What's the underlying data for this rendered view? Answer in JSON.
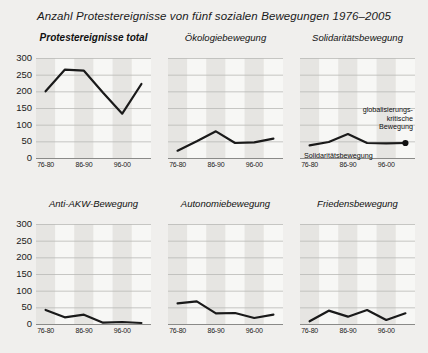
{
  "title": "Anzahl Protestereignisse von fünf sozialen Bewegungen 1976–2005",
  "axis": {
    "y_ticks": [
      "300",
      "250",
      "200",
      "150",
      "100",
      "50",
      "0"
    ],
    "x_ticks": [
      "76-80",
      "86-90",
      "96-00"
    ]
  },
  "annotations": {
    "global_line1": "globalisierungs-",
    "global_line2": "kritische",
    "global_line3": "Bewegung",
    "solidarity_inline": "Solidaritätsbewegung"
  },
  "chart_data": {
    "type": "line",
    "title": "Anzahl Protestereignisse von fünf sozialen Bewegungen 1976–2005",
    "xlabel": "",
    "ylabel": "Anzahl Protestereignisse",
    "ylim": [
      0,
      300
    ],
    "ytick_step": 50,
    "grid": true,
    "legend": "none",
    "categories": [
      "76-80",
      "81-85",
      "86-90",
      "91-95",
      "96-00",
      "01-05"
    ],
    "tick_categories": [
      "76-80",
      "86-90",
      "96-00"
    ],
    "panels": [
      {
        "title": "Protestereignisse total",
        "emphasis": "bold",
        "values": [
          200,
          265,
          262,
          196,
          133,
          222
        ]
      },
      {
        "title": "Ökologiebewegung",
        "emphasis": "normal",
        "values": [
          22,
          50,
          80,
          45,
          47,
          58
        ]
      },
      {
        "title": "Solidaritätsbewegung",
        "emphasis": "normal",
        "values": [
          38,
          48,
          72,
          45,
          44,
          45
        ],
        "endpoint_marker": true,
        "annotations": [
          {
            "text": "globalisierungs-kritische Bewegung",
            "target": "endpoint"
          },
          {
            "text": "Solidaritätsbewegung",
            "target": "series"
          }
        ]
      },
      {
        "title": "Anti-AKW-Bewegung",
        "emphasis": "normal",
        "values": [
          42,
          20,
          28,
          4,
          6,
          3
        ]
      },
      {
        "title": "Autonomiebewegung",
        "emphasis": "normal",
        "values": [
          62,
          68,
          32,
          33,
          18,
          28
        ]
      },
      {
        "title": "Friedensbewegung",
        "emphasis": "normal",
        "values": [
          8,
          40,
          22,
          42,
          12,
          32
        ]
      }
    ]
  }
}
